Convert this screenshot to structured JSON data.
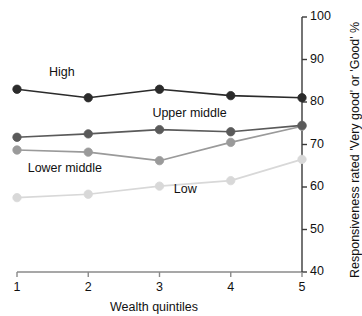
{
  "chart_data": {
    "type": "line",
    "title": "",
    "subtitle": "",
    "xlabel": "Wealth quintiles",
    "ylabel": "Responsiveness rated 'Very good' or 'Good' %",
    "x": [
      1,
      2,
      3,
      4,
      5
    ],
    "categories": [
      "1",
      "2",
      "3",
      "4",
      "5"
    ],
    "xtick_labels": [
      "1",
      "2",
      "3",
      "4",
      "5"
    ],
    "ytick_labels": [
      "40",
      "50",
      "60",
      "70",
      "80",
      "90",
      "100"
    ],
    "ytick_values": [
      40,
      50,
      60,
      70,
      80,
      90,
      100
    ],
    "ylim": [
      40,
      100
    ],
    "xlim": [
      1,
      5
    ],
    "grid": false,
    "legend_position": "inline-annotations",
    "y_axis_side": "right",
    "series": [
      {
        "name": "High",
        "label": "High",
        "color": "#2b2b2b",
        "values": [
          83.0,
          81.0,
          83.0,
          81.5,
          81.0
        ],
        "label_x": 1.45,
        "label_y": 86.5
      },
      {
        "name": "Upper middle",
        "label": "Upper middle",
        "color": "#5a5a5a",
        "values": [
          71.7,
          72.5,
          73.5,
          73.0,
          74.5
        ],
        "label_x": 2.9,
        "label_y": 77.0
      },
      {
        "name": "Lower middle",
        "label": "Lower middle",
        "color": "#9a9a9a",
        "values": [
          68.7,
          68.2,
          66.2,
          70.5,
          74.3
        ],
        "label_x": 1.15,
        "label_y": 64.0
      },
      {
        "name": "Low",
        "label": "Low",
        "color": "#d8d8d8",
        "values": [
          57.5,
          58.3,
          60.2,
          61.5,
          66.5
        ],
        "label_x": 3.2,
        "label_y": 59.0
      }
    ],
    "axis_color": "#8a8a8a",
    "axis_text_color": "#111111"
  }
}
